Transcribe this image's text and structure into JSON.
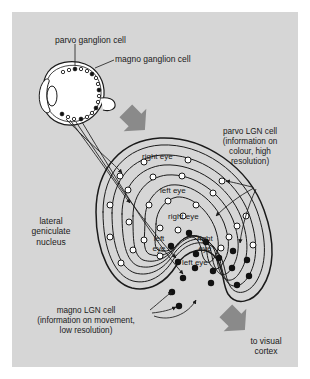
{
  "figure": {
    "panel_color": "#d6d6d6",
    "ink_color": "#1a1a1a",
    "arrow_color": "#8a8a8a",
    "cell_fill_parvo": "#ffffff",
    "cell_fill_magno": "#111111"
  },
  "labels": {
    "parvo_ganglion": "parvo ganglion cell",
    "magno_ganglion": "magno ganglion cell",
    "parvo_lgn": "parvo LGN cell\n(information on\ncolour, high\nresolution)",
    "magno_lgn": "magno LGN cell\n(information on movement,\nlow resolution)",
    "lgn_name": "lateral\ngeniculate\nnucleus",
    "to_cortex": "to visual\ncortex"
  },
  "lgn_layers": [
    {
      "index": 1,
      "eye": "right eye",
      "cell_type": "parvo"
    },
    {
      "index": 2,
      "eye": "left eye",
      "cell_type": "parvo"
    },
    {
      "index": 3,
      "eye": "right eye",
      "cell_type": "parvo"
    },
    {
      "index": 4,
      "eye": "left eye",
      "cell_type": "parvo"
    },
    {
      "index": 5,
      "eye": "right eye",
      "cell_type": "magno"
    },
    {
      "index": 6,
      "eye": "left eye",
      "cell_type": "magno"
    }
  ],
  "layer_labels": {
    "l1": "right eye",
    "l2": "left eye",
    "l3": "right eye",
    "l4_left": "left",
    "l4_eye": "eye",
    "l5_right": "right",
    "l5_eye": "eye",
    "l6": "left eye"
  },
  "eye": {
    "name": "eye",
    "retina_cells": [
      {
        "type": "parvo"
      },
      {
        "type": "parvo"
      },
      {
        "type": "magno"
      },
      {
        "type": "parvo"
      },
      {
        "type": "parvo"
      },
      {
        "type": "magno"
      },
      {
        "type": "parvo"
      },
      {
        "type": "parvo"
      },
      {
        "type": "magno"
      },
      {
        "type": "parvo"
      },
      {
        "type": "parvo"
      },
      {
        "type": "magno"
      },
      {
        "type": "parvo"
      },
      {
        "type": "parvo"
      },
      {
        "type": "magno"
      },
      {
        "type": "parvo"
      },
      {
        "type": "parvo"
      },
      {
        "type": "magno"
      }
    ]
  }
}
